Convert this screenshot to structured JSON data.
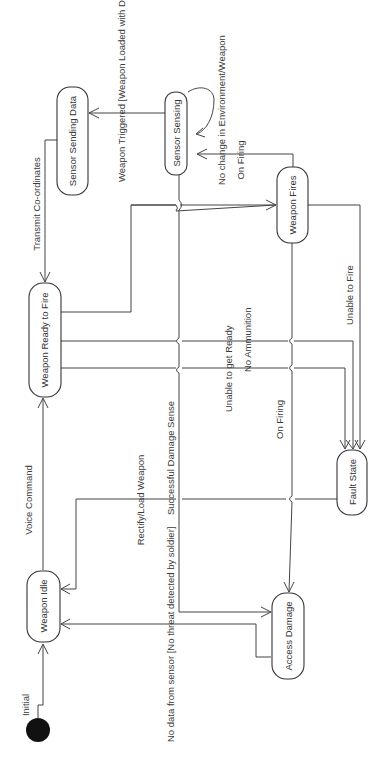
{
  "diagram": {
    "type": "UML state machine diagram (rotated 90° counter-clockwise)",
    "states": [
      {
        "id": "sensor_sending_data",
        "label": "Sensor Sending Data"
      },
      {
        "id": "sensor_sensing",
        "label": "Sensor Sensing"
      },
      {
        "id": "weapon_fires",
        "label": "Weapon Fires"
      },
      {
        "id": "weapon_ready_to_fire",
        "label": "Weapon Ready to Fire"
      },
      {
        "id": "fault_state",
        "label": "Fault State"
      },
      {
        "id": "weapon_idle",
        "label": "Weapon Idle"
      },
      {
        "id": "access_damage",
        "label": "Access Damage"
      }
    ],
    "initial": {
      "label": "Initial"
    },
    "transitions": [
      {
        "from": "initial",
        "to": "weapon_idle",
        "label": "Initial"
      },
      {
        "from": "weapon_idle",
        "to": "weapon_ready_to_fire",
        "label": "Voice Command"
      },
      {
        "from": "sensor_sending_data",
        "to": "weapon_ready_to_fire",
        "label": "Transmit Co-ordinates"
      },
      {
        "from": "sensor_sensing",
        "to": "sensor_sending_data",
        "label": "Detect Movement"
      },
      {
        "from": "sensor_sensing",
        "to": "sensor_sensing",
        "label": "No change in Environment/Weapon"
      },
      {
        "from": "weapon_fires",
        "to": "sensor_sensing",
        "label": "On Firing"
      },
      {
        "from": "weapon_ready_to_fire",
        "to": "weapon_fires",
        "label": "Weapon Triggered [Weapon Loaded with Detect Movement]"
      },
      {
        "from": "weapon_ready_to_fire",
        "to": "fault_state",
        "label": "Unable to get Ready"
      },
      {
        "from": "weapon_ready_to_fire",
        "to": "fault_state",
        "label": "No Ammunition"
      },
      {
        "from": "weapon_fires",
        "to": "fault_state",
        "label": "Unable to Fire"
      },
      {
        "from": "weapon_fires",
        "to": "access_damage",
        "label": "On Firing"
      },
      {
        "from": "fault_state",
        "to": "weapon_idle",
        "label": "Rectify/Load Weapon"
      },
      {
        "from": "sensor_sensing",
        "to": "access_damage",
        "label": "Successful Damage Sense"
      },
      {
        "from": "access_damage",
        "to": "weapon_idle",
        "label": "No data from sensor [No threat detected by soldier]"
      }
    ]
  }
}
